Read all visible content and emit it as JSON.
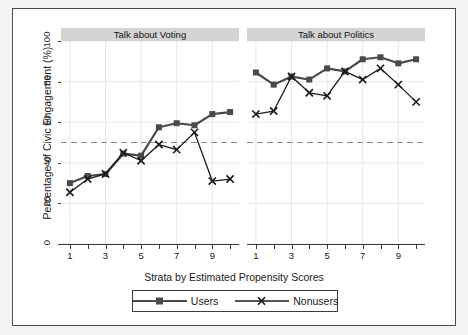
{
  "chart_data": {
    "type": "line",
    "title": "",
    "xlabel": "Strata by Estimated Propensity Scores",
    "ylabel": "Percentage of Civic Engagement (%)",
    "ylim": [
      0,
      100
    ],
    "yticks": [
      0,
      20,
      40,
      60,
      80,
      100
    ],
    "xlim": [
      0.5,
      10.5
    ],
    "xticks": [
      1,
      2,
      3,
      4,
      5,
      6,
      7,
      8,
      9,
      10
    ],
    "xticklabels": [
      "1",
      "",
      "3",
      "",
      "5",
      "",
      "7",
      "",
      "9",
      ""
    ],
    "grid": true,
    "reference_line": {
      "y": 50,
      "style": "dashed",
      "color": "#8c8c94"
    },
    "legend_position": "bottom",
    "legend": [
      "Users",
      "Nonusers"
    ],
    "panels": [
      {
        "title": "Talk about Voting",
        "x": [
          1,
          2,
          3,
          4,
          5,
          6,
          7,
          8,
          9,
          10
        ],
        "series": [
          {
            "name": "Users",
            "marker": "square",
            "values": [
              30,
              33.5,
              34.5,
              44.5,
              43.5,
              57.5,
              59.5,
              58.5,
              64,
              65
            ]
          },
          {
            "name": "Nonusers",
            "marker": "x",
            "values": [
              25.5,
              32,
              34.5,
              45,
              41,
              49,
              46.5,
              55,
              31,
              32
            ]
          }
        ]
      },
      {
        "title": "Talk about Politics",
        "x": [
          1,
          2,
          3,
          4,
          5,
          6,
          7,
          8,
          9,
          10
        ],
        "series": [
          {
            "name": "Users",
            "marker": "square",
            "values": [
              84.5,
              78.5,
              82.5,
              81,
              86.5,
              85,
              91,
              92,
              89,
              91
            ]
          },
          {
            "name": "Nonusers",
            "marker": "x",
            "values": [
              64,
              65.5,
              82.5,
              74.5,
              73,
              85,
              81,
              86.5,
              78.5,
              70
            ]
          }
        ]
      }
    ],
    "colors": {
      "users": "#4a4a4a",
      "nonusers": "#1a1a1a",
      "grid": "#e8e8e8",
      "axis": "#3c3c3c",
      "panel_header": "#d4d4d4",
      "background": "#ffffff",
      "page_background": "#f2f2f0"
    }
  }
}
